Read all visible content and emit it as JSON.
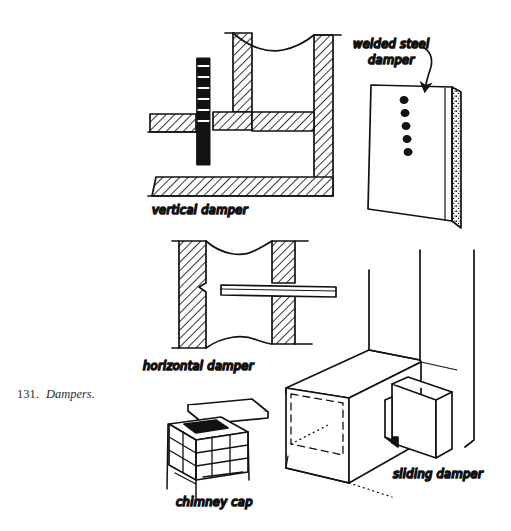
{
  "figure": {
    "caption_number": "131.",
    "caption_text": "Dampers.",
    "background_color": "#ffffff",
    "ink_color": "#121212",
    "width": 511,
    "height": 531
  },
  "labels": {
    "vertical_damper": "vertical damper",
    "welded_steel_line1": "welded steel",
    "welded_steel_line2": "damper",
    "horizontal_damper": "horizontal damper",
    "chimney_cap": "chimney cap",
    "sliding_damper": "sliding damper"
  },
  "drawings": [
    {
      "name": "vertical-damper",
      "label": "vertical damper",
      "description": "Sectional view of a masonry flue with hatched walls, a wavy break line at the top, and a black vertical damper plate with notched rungs sliding through the throat.",
      "features": [
        "hatched masonry section",
        "wavy break line",
        "black notched damper plate",
        "hearth ledge"
      ]
    },
    {
      "name": "welded-steel-damper",
      "label": "welded steel damper",
      "description": "Pictorial view of a rectangular welded steel damper plate, slightly tilted, with five dark bolt heads in a vertical row and a stippled edge strip along the right side.",
      "bolt_count": 5,
      "features": [
        "steel plate",
        "five bolts",
        "stippled edge"
      ]
    },
    {
      "name": "horizontal-damper",
      "label": "horizontal damper",
      "description": "Sectional view with hatched masonry above and below, wavy break lines, and a thin horizontal damper plate sliding through the opening.",
      "features": [
        "hatched masonry section",
        "wavy break lines",
        "horizontal sliding plate"
      ]
    },
    {
      "name": "chimney-cap",
      "label": "chimney cap",
      "description": "Pictorial view of a brick chimney top with coursed brickwork, a dark flue opening, and a flat cap slab supported on corner posts.",
      "features": [
        "brick courses",
        "dark flue opening",
        "flat cap slab",
        "corner posts"
      ]
    },
    {
      "name": "sliding-damper",
      "label": "sliding damper",
      "description": "Isometric view of a masonry fireplace block against a wall, with a damper plate sliding out through a side slot and dash-dot hidden lines showing the concealed opening.",
      "features": [
        "isometric masonry block",
        "sliding plate",
        "hidden dashed lines",
        "wall lines"
      ]
    }
  ]
}
